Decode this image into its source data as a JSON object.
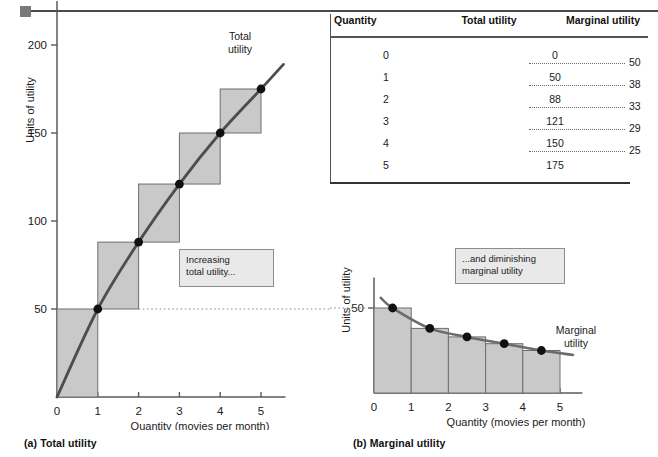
{
  "figure": {
    "panel_a_caption": "(a) Total utility",
    "panel_b_caption": "(b) Marginal utility",
    "callout_total": "Increasing\ntotal utility...",
    "callout_marginal": "...and diminishing\nmarginal utility"
  },
  "table": {
    "headers": [
      "Quantity",
      "Total utility",
      "Marginal utility"
    ],
    "rows": [
      {
        "quantity": "0",
        "total": "0"
      },
      {
        "quantity": "1",
        "total": "50"
      },
      {
        "quantity": "2",
        "total": "88"
      },
      {
        "quantity": "3",
        "total": "121"
      },
      {
        "quantity": "4",
        "total": "150"
      },
      {
        "quantity": "5",
        "total": "175"
      }
    ],
    "marginal": [
      "50",
      "38",
      "33",
      "29",
      "25"
    ]
  },
  "chart_data": [
    {
      "id": "total-utility",
      "type": "area",
      "title": "(a) Total utility",
      "curve_label": "Total\nutility",
      "xlabel": "Quantity (movies per month)",
      "ylabel": "Units of utility",
      "x": [
        0,
        1,
        2,
        3,
        4,
        5
      ],
      "values": [
        0,
        50,
        88,
        121,
        150,
        175
      ],
      "xlim": [
        0,
        5.6
      ],
      "ylim": [
        0,
        225
      ],
      "xticks": [
        0,
        1,
        2,
        3,
        4,
        5
      ],
      "xticklabels": [
        "0",
        "1",
        "2",
        "3",
        "4",
        "5"
      ],
      "yticks": [
        50,
        100,
        150,
        200
      ],
      "yticklabels": [
        "50",
        "100",
        "150",
        "200"
      ],
      "grid": false,
      "legend": "none",
      "annotation": "Increasing total utility...",
      "marker_points": [
        {
          "x": 1,
          "y": 50
        },
        {
          "x": 2,
          "y": 88
        },
        {
          "x": 3,
          "y": 121
        },
        {
          "x": 4,
          "y": 150
        },
        {
          "x": 5,
          "y": 175
        }
      ],
      "step_bars": [
        {
          "x0": 0,
          "x1": 1,
          "y0": 0,
          "y1": 50
        },
        {
          "x0": 1,
          "x1": 2,
          "y0": 50,
          "y1": 88
        },
        {
          "x0": 2,
          "x1": 3,
          "y0": 88,
          "y1": 121
        },
        {
          "x0": 3,
          "x1": 4,
          "y0": 121,
          "y1": 150
        },
        {
          "x0": 4,
          "x1": 5,
          "y0": 150,
          "y1": 175
        }
      ]
    },
    {
      "id": "marginal-utility",
      "type": "bar",
      "title": "(b) Marginal utility",
      "curve_label": "Marginal\nutility",
      "xlabel": "Quantity (movies per month)",
      "ylabel": "Units of utility",
      "categories": [
        "0-1",
        "1-2",
        "2-3",
        "3-4",
        "4-5"
      ],
      "values": [
        50,
        38,
        33,
        29,
        25
      ],
      "xlim": [
        0,
        5.6
      ],
      "ylim": [
        0,
        68
      ],
      "xticks": [
        0,
        1,
        2,
        3,
        4,
        5
      ],
      "xticklabels": [
        "0",
        "1",
        "2",
        "3",
        "4",
        "5"
      ],
      "yticks": [
        50
      ],
      "yticklabels": [
        "50"
      ],
      "grid": false,
      "legend": "none",
      "annotation": "...and diminishing marginal utility",
      "marker_points": [
        {
          "x": 0.5,
          "y": 50
        },
        {
          "x": 1.5,
          "y": 38
        },
        {
          "x": 2.5,
          "y": 33
        },
        {
          "x": 3.5,
          "y": 29
        },
        {
          "x": 4.5,
          "y": 25
        }
      ]
    }
  ],
  "colors": {
    "bar_fill": "#c9c9c9",
    "bar_stroke": "#6e6e6e",
    "curve": "#6b6b6b",
    "curve_dark": "#4d4d4d",
    "marker": "#111111",
    "axis": "#5a5a5a",
    "callout_bg": "#e9e9e9",
    "callout_border": "#8d8d8d",
    "text": "#1a1a1a"
  }
}
